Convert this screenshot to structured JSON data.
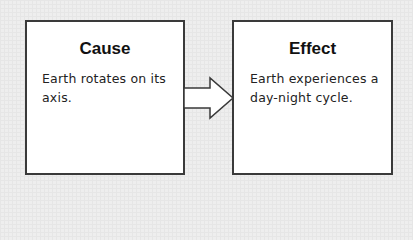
{
  "diagram": {
    "type": "cause-and-effect",
    "cause": {
      "title": "Cause",
      "text": "Earth rotates on its axis."
    },
    "effect": {
      "title": "Effect",
      "text": "Earth experiences a day-night cycle."
    },
    "connector": "right-arrow-icon"
  },
  "colors": {
    "background": "#eeeeee",
    "box_fill": "#ffffff",
    "border": "#3a3a3a",
    "text": "#111111"
  }
}
